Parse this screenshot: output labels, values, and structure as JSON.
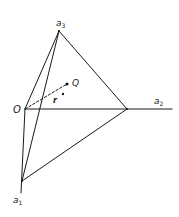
{
  "diagram": {
    "type": "geometric-3d-axes-tetrahedron",
    "labels": {
      "origin": "O",
      "axis1": {
        "base": "a",
        "sub": "1"
      },
      "axis2": {
        "base": "a",
        "sub": "2"
      },
      "axis3": {
        "base": "a",
        "sub": "3"
      },
      "point_q": "Q",
      "point_r": "r",
      "point_r_mark": "*"
    },
    "colors": {
      "line": "#1a1a1a",
      "background": "#ffffff"
    },
    "points": {
      "O": [
        25,
        109
      ],
      "a1": [
        22,
        181
      ],
      "a2": [
        127,
        109
      ],
      "a3": [
        59,
        31
      ],
      "Q": [
        67,
        84
      ],
      "r_star": [
        63,
        94
      ]
    },
    "edges": [
      [
        "O",
        "a3"
      ],
      [
        "O",
        "a2"
      ],
      [
        "O",
        "a1"
      ],
      [
        "a3",
        "a2"
      ],
      [
        "a3",
        "a1"
      ],
      [
        "a1",
        "a2"
      ]
    ],
    "dashed": [
      [
        "O",
        "Q"
      ]
    ]
  }
}
